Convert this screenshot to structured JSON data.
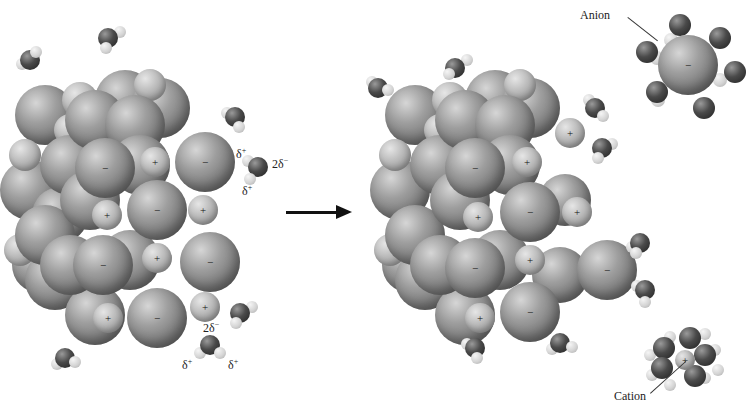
{
  "diagram": {
    "arrow": {
      "direction": "right"
    },
    "labels": {
      "anion": "Anion",
      "cation": "Cation",
      "water_oxygen_charge": "2δ",
      "water_oxygen_charge_sign": "−",
      "water_hydrogen_charge": "δ",
      "water_hydrogen_charge_sign": "+"
    },
    "ion_signs": {
      "anion": "−",
      "cation": "+"
    },
    "colors": {
      "anion": "#808080",
      "cation": "#b5b5b5",
      "oxygen": "#3a3a3a",
      "hydrogen": "#d9d9d9",
      "background": "#ffffff"
    },
    "panels": [
      {
        "name": "before",
        "state": "intact ionic crystal lattice surrounded by water molecules"
      },
      {
        "name": "after",
        "state": "crystal partially dissolved; hydrated anion and hydrated cation separated into solution"
      }
    ]
  }
}
